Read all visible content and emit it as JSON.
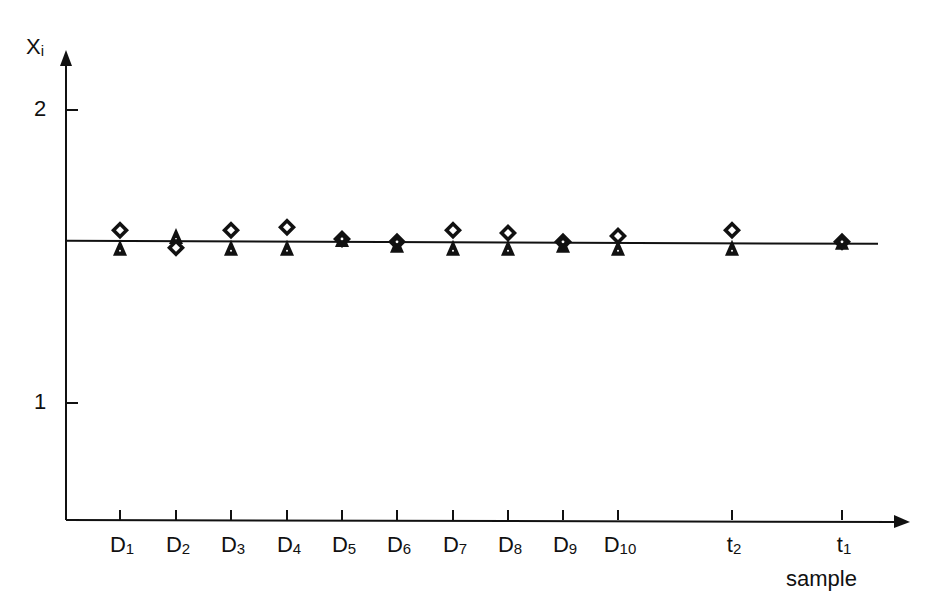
{
  "chart_data": {
    "type": "scatter",
    "title": "",
    "xlabel": "sample",
    "ylabel": "Xi",
    "ylabel_main": "X",
    "ylabel_sub": "i",
    "y_ticks": [
      1,
      2
    ],
    "ylim": [
      0.6,
      2.1
    ],
    "grid": false,
    "legend": null,
    "categories": [
      "D1",
      "D2",
      "D3",
      "D4",
      "D5",
      "D6",
      "D7",
      "D8",
      "D9",
      "D10",
      "t2",
      "t1"
    ],
    "category_labels": [
      {
        "main": "D",
        "sub": "1"
      },
      {
        "main": "D",
        "sub": "2"
      },
      {
        "main": "D",
        "sub": "3"
      },
      {
        "main": "D",
        "sub": "4"
      },
      {
        "main": "D",
        "sub": "5"
      },
      {
        "main": "D",
        "sub": "6"
      },
      {
        "main": "D",
        "sub": "7"
      },
      {
        "main": "D",
        "sub": "8"
      },
      {
        "main": "D",
        "sub": "9"
      },
      {
        "main": "D",
        "sub": "10"
      },
      {
        "main": "t",
        "sub": "2"
      },
      {
        "main": "t",
        "sub": "1"
      }
    ],
    "reference_line": {
      "y": 1.55,
      "label": ""
    },
    "series": [
      {
        "name": "diamond (open)",
        "marker": "diamond",
        "values": [
          1.59,
          1.53,
          1.59,
          1.6,
          1.56,
          1.55,
          1.59,
          1.58,
          1.55,
          1.57,
          1.59,
          1.55
        ]
      },
      {
        "name": "triangle (filled)",
        "marker": "triangle",
        "values": [
          1.53,
          1.57,
          1.53,
          1.53,
          1.56,
          1.54,
          1.53,
          1.53,
          1.54,
          1.53,
          1.53,
          1.55
        ]
      }
    ]
  },
  "layout": {
    "axis_color": "#111111",
    "marker_color": "#111111"
  }
}
